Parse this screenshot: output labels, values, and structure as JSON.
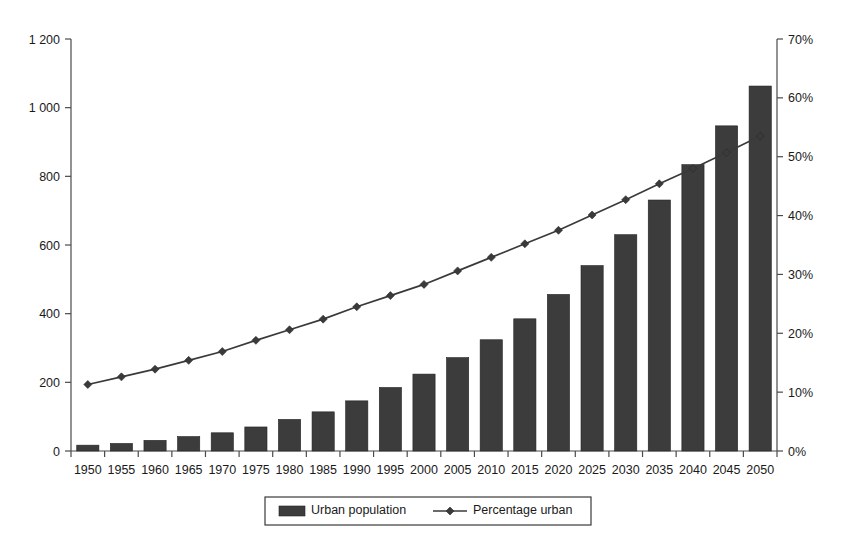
{
  "chart_data": {
    "type": "bar",
    "title": "",
    "subtitle": "",
    "xlabel": "",
    "ylabel": "",
    "categories": [
      "1950",
      "1955",
      "1960",
      "1965",
      "1970",
      "1975",
      "1980",
      "1985",
      "1990",
      "1995",
      "2000",
      "2005",
      "2010",
      "2015",
      "2020",
      "2025",
      "2030",
      "2035",
      "2040",
      "2045",
      "2050"
    ],
    "series": [
      {
        "name": "Urban population",
        "type": "bar",
        "axis": "left",
        "unit": "millions",
        "color": "#3c3c3c",
        "values": [
          17,
          22,
          31,
          42,
          53,
          70,
          92,
          114,
          146,
          185,
          224,
          272,
          324,
          385,
          456,
          540,
          630,
          731,
          834,
          947,
          1063
        ]
      },
      {
        "name": "Percentage urban",
        "type": "line",
        "axis": "right",
        "unit": "%",
        "color": "#3a3a3a",
        "marker": "diamond",
        "values": [
          11.3,
          12.6,
          13.9,
          15.4,
          16.9,
          18.8,
          20.6,
          22.4,
          24.5,
          26.4,
          28.3,
          30.6,
          32.9,
          35.2,
          37.5,
          40.1,
          42.7,
          45.4,
          48.0,
          50.7,
          53.5
        ]
      }
    ],
    "percentage_urban_plotted": [
      11.3,
      12.6,
      13.9,
      15.4,
      16.9,
      18.8,
      20.6,
      22.4,
      24.5,
      26.4,
      28.3,
      30.6,
      32.9,
      35.2,
      37.5,
      40.1,
      42.7,
      45.4,
      48.0,
      50.7,
      53.5
    ],
    "left_axis": {
      "label": "",
      "min": 0,
      "max": 1200,
      "step": 200,
      "ticks": [
        0,
        200,
        400,
        600,
        800,
        1000,
        1200
      ],
      "tick_labels": [
        "0",
        "200",
        "400",
        "600",
        "800",
        "1 000",
        "1 200"
      ]
    },
    "right_axis": {
      "label": "",
      "min": 0,
      "max": 70,
      "step": 10,
      "ticks": [
        0,
        10,
        20,
        30,
        40,
        50,
        60,
        70
      ],
      "tick_labels": [
        "0%",
        "10%",
        "20%",
        "30%",
        "40%",
        "50%",
        "60%",
        "70%"
      ]
    },
    "grid": false,
    "legend": {
      "position": "bottom",
      "bordered": true,
      "entries": [
        {
          "label": "Urban population",
          "marker": "bar",
          "color": "#3c3c3c"
        },
        {
          "label": "Percentage urban",
          "marker": "line-diamond",
          "color": "#3a3a3a"
        }
      ]
    }
  }
}
